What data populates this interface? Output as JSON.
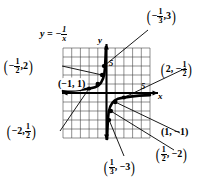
{
  "figure": {
    "name": "graph-of-y-equals-negative-one-over-x",
    "equation_label": "y = − 1/x",
    "equation_parts": {
      "lhs": "y",
      "eq": "=",
      "sign": "−",
      "num": "1",
      "den": "x"
    },
    "axis_labels": {
      "x": "x",
      "y": "y"
    },
    "tick_labels": {
      "x_five": "5",
      "y_five": "5"
    },
    "grid": {
      "columns": 10,
      "rows": 10,
      "xmin": -5,
      "xmax": 5,
      "ymin": -5,
      "ymax": 5
    },
    "points": [
      {
        "id": "p-neg-half-2",
        "x": -0.5,
        "y": 2,
        "label_x": "−",
        "label_x_num": "1",
        "label_x_den": "2",
        "label_y": "2",
        "text": "(−1/2, 2)"
      },
      {
        "id": "p-neg-third-3",
        "x": -0.3333,
        "y": 3,
        "label_x": "−",
        "label_x_num": "1",
        "label_x_den": "3",
        "label_y": "3",
        "text": "(−1/3, 3)"
      },
      {
        "id": "p-neg1-1",
        "x": -1,
        "y": 1,
        "text": "(−1, 1)"
      },
      {
        "id": "p-neg2-half",
        "x": -2,
        "y": 0.5,
        "label_x": "−2",
        "label_y_num": "1",
        "label_y_den": "2",
        "text": "(−2, 1/2)"
      },
      {
        "id": "p-2-neg-half",
        "x": 2,
        "y": -0.5,
        "label_x": "2",
        "label_y": "−",
        "label_y_num": "1",
        "label_y_den": "2",
        "text": "(2, −1/2)"
      },
      {
        "id": "p-1-neg1",
        "x": 1,
        "y": -1,
        "text": "(1, −1)"
      },
      {
        "id": "p-half-neg2",
        "x": 0.5,
        "y": -2,
        "label_x_num": "1",
        "label_x_den": "2",
        "label_y": "−2",
        "text": "(1/2, −2)"
      },
      {
        "id": "p-third-neg3",
        "x": 0.3333,
        "y": -3,
        "label_x_num": "1",
        "label_x_den": "3",
        "label_y": "−3",
        "text": "(1/3, −3)"
      }
    ],
    "callouts": {
      "neg_half_2": {
        "open": "(",
        "minus": "−",
        "num": "1",
        "den": "2",
        "comma": ",",
        "val": "2",
        "close": ")"
      },
      "neg_third_3": {
        "open": "(",
        "minus": "−",
        "num": "1",
        "den": "3",
        "comma": ",",
        "val": "3",
        "close": ")"
      },
      "neg1_1": {
        "text": "(−1, 1)"
      },
      "neg2_half": {
        "open": "(",
        "first": "−2,",
        "num": "1",
        "den": "2",
        "close": ")"
      },
      "two_neg_half": {
        "open": "(",
        "first": "2, −",
        "num": "1",
        "den": "2",
        "close": ")"
      },
      "one_neg1": {
        "text": "(1, −1)"
      },
      "half_neg2": {
        "open": "(",
        "num": "1",
        "den": "2",
        "rest": ", −2",
        "close": ")"
      },
      "third_neg3": {
        "open": "(",
        "num": "1",
        "den": "3",
        "rest": ", −3",
        "close": ")"
      }
    },
    "colors": {
      "ink": "#000000",
      "grid": "#3a3a3a",
      "paper": "#ffffff"
    }
  }
}
